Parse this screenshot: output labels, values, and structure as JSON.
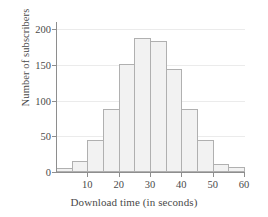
{
  "chart_data": {
    "type": "bar",
    "title": "",
    "xlabel": "Download time (in seconds)",
    "ylabel": "Number of subscribers",
    "categories": [
      "0-5",
      "5-10",
      "10-15",
      "15-20",
      "20-25",
      "25-30",
      "30-35",
      "35-40",
      "40-45",
      "45-50",
      "50-55",
      "55-60"
    ],
    "bin_starts": [
      0,
      5,
      10,
      15,
      20,
      25,
      30,
      35,
      40,
      45,
      50,
      55
    ],
    "bin_width": 5,
    "values": [
      5,
      15,
      45,
      88,
      151,
      188,
      184,
      144,
      88,
      45,
      11,
      7
    ],
    "xlim": [
      0,
      60
    ],
    "ylim": [
      0,
      210
    ],
    "xticks": [
      10,
      20,
      30,
      40,
      50,
      60
    ],
    "yticks": [
      0,
      50,
      100,
      150,
      200
    ],
    "xtick_labels": [
      "10",
      "20",
      "30",
      "40",
      "50",
      "60"
    ],
    "ytick_labels": [
      "0",
      "50",
      "100",
      "150",
      "200"
    ],
    "grid": true,
    "legend": false,
    "bar_fill": "#f2f2f2",
    "bar_border": "#b0b0b0",
    "axis_color": "#8e8e8e",
    "grid_color": "#ebebeb",
    "text_color": "#4a4a4a"
  }
}
